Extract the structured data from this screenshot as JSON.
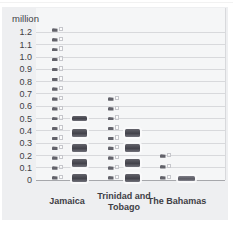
{
  "chart_data": {
    "type": "pictogram_bar",
    "title": "",
    "unit_label": "million",
    "ylabel": "million",
    "xlabel": "",
    "ylim": [
      0,
      1.25
    ],
    "grid": true,
    "legend": "none",
    "y_ticks": [
      "1.2",
      "1.1",
      "1.0",
      "0.9",
      "0.8",
      "0.7",
      "0.6",
      "0.5",
      "0.4",
      "0.3",
      "0.2",
      "0.1",
      "0"
    ],
    "categories": [
      "Jamaica",
      "Trinidad and Tobago",
      "The Bahamas"
    ],
    "series": [
      {
        "name": "small-light-pictogram-stack",
        "icon_style": "small light two-part pictogram",
        "categories": [
          {
            "category": "Jamaica",
            "value": 1.2,
            "icons": 16
          },
          {
            "category": "Trinidad and Tobago",
            "value": 0.65,
            "icons": 9
          },
          {
            "category": "The Bahamas",
            "value": 0.25,
            "icons": 3
          }
        ]
      },
      {
        "name": "large-dark-pictogram-stack",
        "icon_style": "large dark block pictogram",
        "categories": [
          {
            "category": "Jamaica",
            "value": 0.5,
            "icons": 5,
            "top_partial": true
          },
          {
            "category": "Trinidad and Tobago",
            "value": 0.4,
            "icons": 4
          },
          {
            "category": "The Bahamas",
            "value": 0.07,
            "icons": 1,
            "flat": true
          }
        ]
      }
    ]
  },
  "colors": {
    "panel_bg": "#eeeff1",
    "plot_bg": "#f5f6f7",
    "grid_color": "#d8d9dc",
    "axis_color": "#a6a7ab",
    "text_color": "#3e3e45",
    "icon_light_dark_part": "#62626a",
    "icon_light_outline": "#c6c7cc",
    "icon_dark": "#4a4a52"
  }
}
